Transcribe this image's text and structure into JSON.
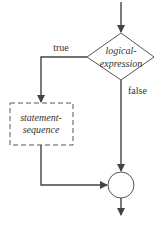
{
  "diagram": {
    "type": "flowchart-if",
    "decision": {
      "line1": "logical-",
      "line2": "expression"
    },
    "process": {
      "line1": "statement-",
      "line2": "sequence",
      "style": "dashed"
    },
    "branches": {
      "true_label": "true",
      "false_label": "false"
    },
    "colors": {
      "stroke": "#444444",
      "text": "#333333",
      "background": "#ffffff"
    }
  }
}
